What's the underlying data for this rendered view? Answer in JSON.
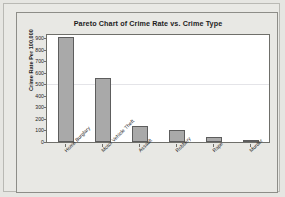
{
  "chart_data": {
    "type": "bar",
    "title": "Pareto Chart of Crime Rate vs. Crime Type",
    "xlabel": "",
    "ylabel": "Crime Rate Per 100,000",
    "categories": [
      "Home Burglary",
      "Motor Vehicle Theft",
      "Assault",
      "Robbery",
      "Rape",
      "Murder"
    ],
    "values": [
      915,
      560,
      135,
      105,
      45,
      10
    ],
    "ylim": [
      0,
      930
    ],
    "yticks": [
      0,
      100,
      200,
      300,
      400,
      500,
      600,
      700,
      800,
      900
    ],
    "ytick_labels": [
      "0",
      "100",
      "200",
      "300",
      "400",
      "500",
      "600",
      "700",
      "800",
      "900"
    ],
    "grid": false,
    "legend": null,
    "bar_color": "#a9a9a9",
    "bar_edge_color": "#5d5d5d",
    "plot_background": "#ffffff",
    "figure_background": "#e8e8e4",
    "axis_color": "#6f6f6a",
    "text_color": "#1d1d1d"
  }
}
